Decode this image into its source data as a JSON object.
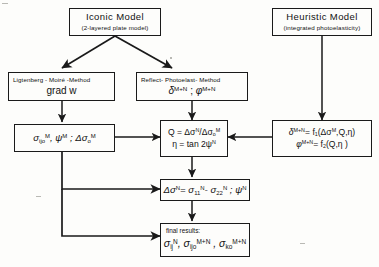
{
  "diagram": {
    "background_color": "#fdfdfb",
    "line_color": "#1a1a1a",
    "nodes": {
      "iconic_model": {
        "title": "Iconic   Model",
        "subtitle": "(2-layered  plate model)"
      },
      "heuristic_model": {
        "title": "Heuristic  Model",
        "subtitle": "(integrated  photoelasticity)"
      },
      "ligtenberg": {
        "label": "Ligtenberg - Moiré -Method",
        "formula": "grad  w"
      },
      "reflect_photoelast": {
        "label": "Reflect- Photoelast- Method",
        "formula_delta": "δ",
        "formula_delta_sup": "M+N",
        "formula_sep": ";",
        "formula_phi": "φ",
        "formula_phi_sup": "M+N"
      },
      "sigma_m": {
        "line1_a": "σ",
        "line1_a_sub": "ijo",
        "line1_a_sup": "M",
        "line1_b": ", ψ",
        "line1_b_sup": "M",
        "line1_c": " ; Δσ",
        "line1_c_sub": "o",
        "line1_c_sup": "M"
      },
      "q_eta": {
        "line1": "Q = Δσ",
        "line1_sup1": "N",
        "line1_mid": "/Δσ",
        "line1_sub2": "o",
        "line1_sup2": "M",
        "line2": "η = tan 2ψ",
        "line2_sup": "N"
      },
      "delta_phi_fn": {
        "line1_a": "δ",
        "line1_a_sup": "M+N",
        "line1_b": "= f",
        "line1_b_sub": "1",
        "line1_c": "(Δσ",
        "line1_c_sup": "M",
        "line1_d": ",Q,η)",
        "line2_a": "φ",
        "line2_a_sup": "M+N",
        "line2_b": "= f",
        "line2_b_sub": "2",
        "line2_c": "(Q,η )"
      },
      "delta_sigma_n": {
        "a": "Δσ",
        "a_sup": "N",
        "b": "= σ",
        "b_sub": "11",
        "b_sup": "N",
        "c": "- σ",
        "c_sub": "22",
        "c_sup": "N",
        "d": " ; ψ",
        "d_sup": "N"
      },
      "final_results": {
        "label": "final results:",
        "r1": "σ",
        "r1_sub": "ij",
        "r1_sup": "N",
        "r2": ", σ",
        "r2_sub": "ijo",
        "r2_sup": "M+N",
        "r3": " , σ",
        "r3_sub": "ko",
        "r3_sup": "M+N"
      }
    }
  }
}
